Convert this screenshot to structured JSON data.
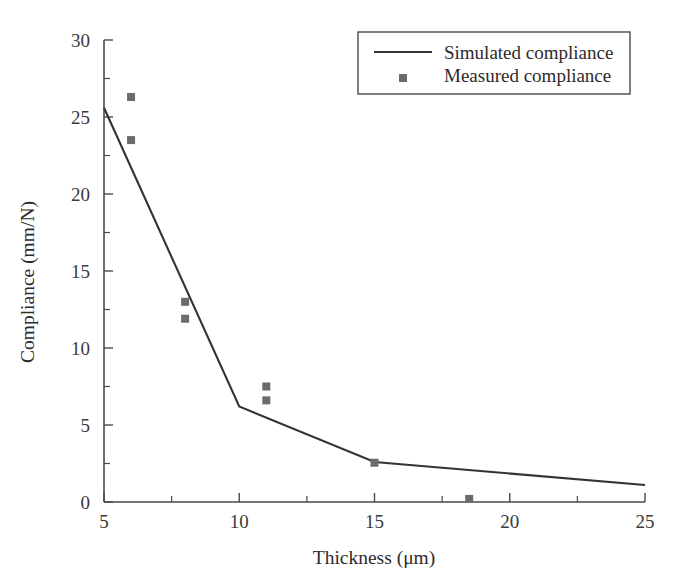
{
  "chart_data": {
    "type": "line",
    "title": "",
    "xlabel": "Thickness (μm)",
    "ylabel": "Compliance (mm/N)",
    "xlim": [
      5,
      25
    ],
    "ylim": [
      0,
      30
    ],
    "xticks": [
      5,
      10,
      15,
      20,
      25
    ],
    "xtick_labels": [
      "5",
      "10",
      "15",
      "20",
      "25"
    ],
    "xminor_ticks": [
      7.5,
      12.5,
      17.5,
      22.5
    ],
    "yticks": [
      0,
      5,
      10,
      15,
      20,
      25,
      30
    ],
    "ytick_labels": [
      "0",
      "5",
      "10",
      "15",
      "20",
      "25",
      "30"
    ],
    "yminor_ticks": [
      2.5,
      7.5,
      12.5,
      17.5,
      22.5,
      27.5
    ],
    "grid": false,
    "legend_position": "top-right",
    "series": [
      {
        "name": "Simulated compliance",
        "type": "line",
        "color": "#333333",
        "x": [
          5,
          10,
          15,
          25
        ],
        "y": [
          25.6,
          6.2,
          2.6,
          1.1
        ]
      },
      {
        "name": "Measured compliance",
        "type": "scatter",
        "marker": "square",
        "color": "#6b6b6b",
        "x": [
          6,
          6,
          8,
          8,
          11,
          11,
          15,
          18.5
        ],
        "y": [
          26.3,
          23.5,
          13.0,
          11.9,
          7.5,
          6.6,
          2.55,
          0.2
        ]
      }
    ]
  },
  "legend": {
    "items": [
      {
        "label": "Simulated compliance",
        "marker": "line"
      },
      {
        "label": "Measured compliance",
        "marker": "square"
      }
    ]
  },
  "axes": {
    "x_title": "Thickness (μm)",
    "y_title": "Compliance (mm/N)"
  }
}
